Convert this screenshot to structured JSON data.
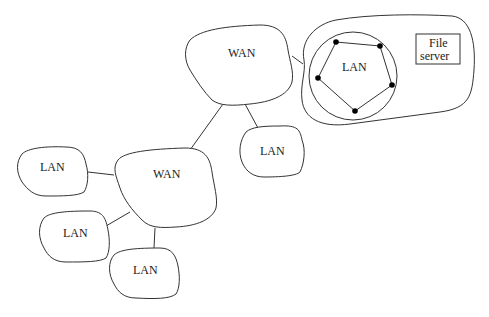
{
  "diagram": {
    "title": "",
    "nodes": [
      {
        "id": "wan_top",
        "type": "WAN",
        "label": "WAN"
      },
      {
        "id": "wan_bottom",
        "type": "WAN",
        "label": "WAN"
      },
      {
        "id": "lan_left",
        "type": "LAN",
        "label": "LAN"
      },
      {
        "id": "lan_lower_left",
        "type": "LAN",
        "label": "LAN"
      },
      {
        "id": "lan_bottom",
        "type": "LAN",
        "label": "LAN"
      },
      {
        "id": "lan_middle",
        "type": "LAN",
        "label": "LAN"
      },
      {
        "id": "lan_ring",
        "type": "LAN",
        "label": "LAN",
        "topology": "ring",
        "station_count": 5
      },
      {
        "id": "file_server",
        "type": "server",
        "label_line1": "File",
        "label_line2": "server"
      }
    ],
    "edges": [
      [
        "wan_top",
        "site_group"
      ],
      [
        "wan_top",
        "wan_bottom"
      ],
      [
        "wan_top",
        "lan_middle"
      ],
      [
        "wan_bottom",
        "lan_left"
      ],
      [
        "wan_bottom",
        "lan_lower_left"
      ],
      [
        "wan_bottom",
        "lan_bottom"
      ],
      [
        "lan_ring",
        "file_server"
      ]
    ]
  },
  "labels": {
    "wan_top": "WAN",
    "wan_bottom": "WAN",
    "lan_left": "LAN",
    "lan_lower_left": "LAN",
    "lan_bottom": "LAN",
    "lan_middle": "LAN",
    "lan_ring": "LAN",
    "file_server_1": "File",
    "file_server_2": "server"
  }
}
